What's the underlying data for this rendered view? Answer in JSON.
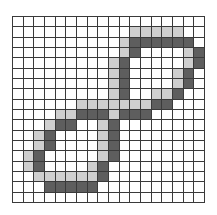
{
  "figure": {
    "title": "",
    "grid": {
      "rows": 18,
      "cols": 18
    },
    "colors": {
      "empty": "#ffffff",
      "light": "#cfcfcf",
      "dark": "#5e5e5e",
      "gridline": "#3a3a3a"
    },
    "cells": [
      {
        "row": 1,
        "light": [
          11,
          12,
          13,
          14,
          15
        ],
        "dark": []
      },
      {
        "row": 2,
        "light": [
          10
        ],
        "dark": [
          11,
          12,
          13,
          14,
          15,
          16
        ]
      },
      {
        "row": 3,
        "light": [
          10,
          16
        ],
        "dark": [
          11,
          17
        ]
      },
      {
        "row": 4,
        "light": [
          9,
          16
        ],
        "dark": [
          10,
          17
        ]
      },
      {
        "row": 5,
        "light": [
          9,
          15
        ],
        "dark": [
          10,
          16
        ]
      },
      {
        "row": 6,
        "light": [
          9,
          15
        ],
        "dark": [
          10,
          16
        ]
      },
      {
        "row": 7,
        "light": [
          9,
          13,
          14
        ],
        "dark": [
          10,
          15
        ]
      },
      {
        "row": 8,
        "light": [
          6,
          7,
          8,
          9,
          10,
          11,
          12
        ],
        "dark": [
          13,
          14
        ]
      },
      {
        "row": 9,
        "light": [
          4,
          5,
          9
        ],
        "dark": [
          6,
          7,
          8,
          10,
          11,
          12
        ]
      },
      {
        "row": 10,
        "light": [
          3,
          8
        ],
        "dark": [
          4,
          5,
          9
        ]
      },
      {
        "row": 11,
        "light": [
          2,
          8
        ],
        "dark": [
          3,
          9
        ]
      },
      {
        "row": 12,
        "light": [
          2,
          8
        ],
        "dark": [
          3,
          9
        ]
      },
      {
        "row": 13,
        "light": [
          1,
          8
        ],
        "dark": [
          2,
          9
        ]
      },
      {
        "row": 14,
        "light": [
          1,
          7
        ],
        "dark": [
          2,
          8
        ]
      },
      {
        "row": 15,
        "light": [
          2,
          3,
          4,
          5,
          6,
          7
        ],
        "dark": [
          8
        ]
      },
      {
        "row": 16,
        "light": [],
        "dark": [
          3,
          4,
          5,
          6,
          7
        ]
      }
    ]
  }
}
